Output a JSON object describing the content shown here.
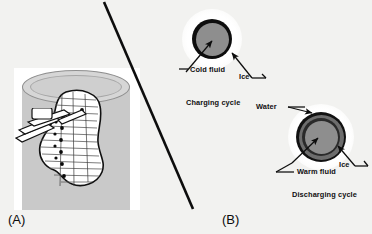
{
  "figure": {
    "background_color": "#f2f2f0",
    "width": 372,
    "height": 234
  },
  "panels": [
    {
      "id": "A",
      "label": "(A)",
      "caption": "",
      "description_icon": "ice-storage-tank-cutaway-icon"
    },
    {
      "id": "B",
      "label": "(B)",
      "caption": "",
      "description_icon": "charge-discharge-cycle-diagram-icon"
    }
  ],
  "panel_a": {
    "label": "(A)",
    "tank_fill_color": "#c9c9c9",
    "tank_top_color": "#d6d6d6",
    "coil_color": "#ffffff",
    "outline_color": "#111111"
  },
  "panel_b": {
    "label": "(B)",
    "charging": {
      "title": "Charging cycle",
      "annotations": [
        {
          "name": "cold-fluid",
          "text": "Cold fluid"
        },
        {
          "name": "ice",
          "text": "Ice"
        }
      ],
      "layers": [
        {
          "name": "ice",
          "color": "#ffffff"
        },
        {
          "name": "tube-wall",
          "color": "#0d0d0d"
        },
        {
          "name": "cold-fluid",
          "color": "#8e8e8e"
        }
      ]
    },
    "discharging": {
      "title": "Discharging cycle",
      "annotations": [
        {
          "name": "water",
          "text": "Water"
        },
        {
          "name": "ice",
          "text": "Ice"
        },
        {
          "name": "warm-fluid",
          "text": "Warm fluid"
        }
      ],
      "layers": [
        {
          "name": "ice",
          "color": "#ffffff"
        },
        {
          "name": "tube-wall",
          "color": "#111111"
        },
        {
          "name": "water",
          "color": "#6d6d6d"
        },
        {
          "name": "inner-wall",
          "color": "#2a2a2a"
        },
        {
          "name": "warm-fluid",
          "color": "#8e8e8e"
        }
      ]
    }
  },
  "labels": {
    "cold_fluid": "Cold fluid",
    "ice_top": "Ice",
    "charging_cycle": "Charging cycle",
    "water": "Water",
    "ice_bottom": "Ice",
    "warm_fluid": "Warm fluid",
    "discharging_cycle": "Discharging cycle",
    "panel_a": "(A)",
    "panel_b": "(B)"
  },
  "colors": {
    "background": "#f2f2f0",
    "ink": "#101010",
    "fluid_gray": "#8e8e8e",
    "water_gray": "#6d6d6d",
    "ice_white": "#ffffff",
    "tank_gray": "#c9c9c9"
  }
}
